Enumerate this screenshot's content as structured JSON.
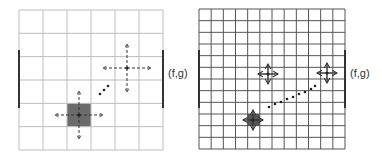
{
  "panels": [
    {
      "name": "coarse-grid",
      "grid": {
        "x": 19,
        "y": 10,
        "width": 144,
        "height": 140,
        "cols": 6,
        "rows": 6,
        "line_color": "#bdbdbd"
      },
      "highlight_cell": {
        "col": 2,
        "row": 4,
        "color": "#6b6b6b"
      },
      "boundary_bars": [
        {
          "x": 19,
          "y1": 50,
          "y2": 108
        },
        {
          "x": 163,
          "y1": 50,
          "y2": 108
        }
      ],
      "nodes": [
        {
          "x": 79,
          "y": 115,
          "style": "dashed",
          "arm": 24
        },
        {
          "x": 127,
          "y": 68,
          "style": "dashed",
          "arm": 24
        }
      ],
      "dots": [
        [
          100,
          94
        ],
        [
          104,
          90
        ],
        [
          108,
          86
        ]
      ],
      "label": {
        "text": "(f,g)",
        "x": 168,
        "y": 74
      }
    },
    {
      "name": "fine-grid",
      "grid": {
        "x": 199,
        "y": 9,
        "width": 146,
        "height": 140,
        "cols": 12,
        "rows": 12,
        "line_color": "#555555"
      },
      "highlight_cell": {
        "col": 4,
        "row": 9,
        "color": "#555555"
      },
      "boundary_bars": [
        {
          "x": 199,
          "y1": 50,
          "y2": 108
        },
        {
          "x": 345,
          "y1": 50,
          "y2": 108
        }
      ],
      "nodes": [
        {
          "x": 253,
          "y": 120,
          "style": "solid",
          "arm": 10
        },
        {
          "x": 268,
          "y": 74,
          "style": "solid",
          "arm": 10
        },
        {
          "x": 327,
          "y": 73,
          "style": "solid",
          "arm": 10
        }
      ],
      "dots": [
        [
          269,
          107
        ],
        [
          275,
          104
        ],
        [
          281,
          102
        ],
        [
          287,
          99
        ],
        [
          293,
          97
        ],
        [
          299,
          94
        ],
        [
          305,
          92
        ],
        [
          311,
          89
        ],
        [
          315,
          86
        ]
      ],
      "label": {
        "text": "(f,g)",
        "x": 350,
        "y": 74
      }
    }
  ]
}
